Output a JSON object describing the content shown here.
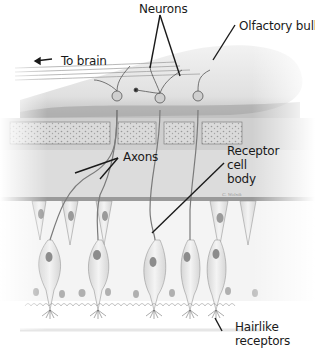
{
  "labels": {
    "neurons": "Neurons",
    "olfactory_bulb": "Olfactory bulb",
    "to_brain": "To brain",
    "axons": "Axons",
    "receptor_cell_body": {
      "line1": "Receptor",
      "line2": "cell",
      "line3": "body"
    },
    "hairlike_receptors": {
      "line1": "Hairlike",
      "line2": "receptors"
    },
    "signature": "C. Wolnik"
  },
  "colors": {
    "bulb_fill": "#e6e6e6",
    "bulb_shadow": "#a8a8a8",
    "bone_fill": "#d8d8d8",
    "bone_pores": "#9a9a9a",
    "tissue_fill": "#dcdcdc",
    "cell_fill": "#ececec",
    "nucleus": "#8c8c8c",
    "line": "#222222"
  }
}
